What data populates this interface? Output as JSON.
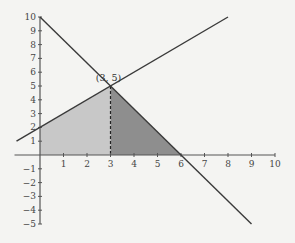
{
  "diagram": {
    "type": "linear-programming-feasible-region",
    "x_axis": {
      "min": -1,
      "max": 10,
      "ticks": [
        "1",
        "2",
        "3",
        "4",
        "5",
        "6",
        "7",
        "8",
        "9",
        "10"
      ]
    },
    "y_axis": {
      "min": -5,
      "max": 10,
      "ticks": [
        "10",
        "9",
        "8",
        "7",
        "6",
        "5",
        "4",
        "3",
        "2",
        "1",
        "-1",
        "-2",
        "-3",
        "-4",
        "-5"
      ]
    },
    "lines": [
      {
        "name": "line-a",
        "equation": "y = 10 - 5x/3",
        "from": [
          0,
          10
        ],
        "to": [
          9,
          -5
        ]
      },
      {
        "name": "line-b",
        "equation": "y = x + 2",
        "from": [
          -1,
          1
        ],
        "to": [
          8,
          10
        ]
      }
    ],
    "intersection": {
      "x": 3,
      "y": 5,
      "label": "(3, 5)"
    },
    "regions": [
      {
        "name": "left-region",
        "vertices": [
          [
            0,
            0
          ],
          [
            0,
            2
          ],
          [
            3,
            5
          ],
          [
            3,
            0
          ]
        ],
        "color": "#c8c8c8"
      },
      {
        "name": "right-region",
        "vertices": [
          [
            3,
            0
          ],
          [
            3,
            5
          ],
          [
            6,
            0
          ]
        ],
        "color": "#8e8e8e"
      }
    ],
    "colors": {
      "line": "#3a3a3a",
      "axis": "#555555",
      "background": "#f4f4f2"
    }
  }
}
